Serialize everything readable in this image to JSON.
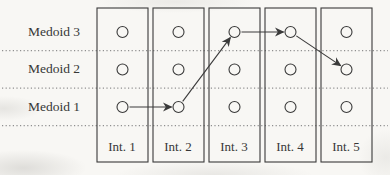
{
  "figure": {
    "row_labels": [
      "Medoid 3",
      "Medoid 2",
      "Medoid 1"
    ],
    "column_labels": [
      "Int. 1",
      "Int. 2",
      "Int. 3",
      "Int. 4",
      "Int. 5"
    ],
    "medoid_path": [
      {
        "column": 0,
        "row": 2
      },
      {
        "column": 1,
        "row": 2
      },
      {
        "column": 2,
        "row": 0
      },
      {
        "column": 3,
        "row": 0
      },
      {
        "column": 4,
        "row": 1
      }
    ],
    "colors": {
      "solid_line": "#3a3a3a",
      "dotted_line": "#8f8f8f",
      "text": "#373737",
      "background": "#f8f7f4"
    }
  }
}
